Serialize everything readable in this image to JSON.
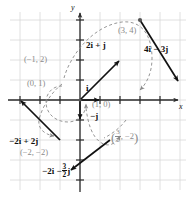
{
  "figure": {
    "type": "vector-diagram",
    "axes": {
      "x_label": "x",
      "y_label": "y",
      "x_range": [
        -4,
        5
      ],
      "y_range": [
        -4,
        5
      ],
      "grid": true,
      "grid_spacing": 1,
      "origin_px": [
        80,
        100
      ],
      "unit_px": 20
    },
    "colors": {
      "background": "#ffffff",
      "grid": "#d8d8d8",
      "axis": "#2b2b2b",
      "vector": "#111111",
      "dashed": "#8a8a8a",
      "coordinate_label": "#8a8a8a"
    },
    "vectors": [
      {
        "id": "vector-2i-plus-j",
        "label": "2i + j",
        "tip": [
          2,
          1
        ],
        "tail": [
          0,
          0
        ],
        "point_label": null
      },
      {
        "id": "vector-i",
        "label": "i",
        "tip": [
          1,
          0
        ],
        "tail": [
          0,
          0
        ],
        "point_label": "(1, 0)"
      },
      {
        "id": "vector-minus-j",
        "label": "−j",
        "tip": [
          0,
          -1
        ],
        "tail": [
          0,
          0
        ],
        "point_label": null
      },
      {
        "id": "vector-4i-minus-3j",
        "label": "4i − 3j",
        "tip": [
          5,
          -1
        ],
        "tail": [
          3,
          4
        ],
        "point_label": "(3, 4)"
      },
      {
        "id": "vector-minus-2i-plus-2j",
        "label": "−2i + 2j",
        "tip": [
          -3,
          0
        ],
        "tail": [
          -1,
          -2
        ],
        "point_label": "(−2, −2)"
      },
      {
        "id": "vector-minus-2i-minus-three-halves-j",
        "label": "−2i − (3/2)j",
        "tip": [
          -0.5,
          -3.5
        ],
        "tail": [
          1.5,
          -2
        ],
        "point_label": "(3/2, −2)"
      }
    ],
    "labels": {
      "two_i_plus_j": "2i + j",
      "four_i_minus_three_j": "4i − 3j",
      "minus_two_i_plus_two_j": "−2i + 2j",
      "unit_i": "i",
      "unit_minus_j": "−j",
      "minus_two_i": "−2i −",
      "three_halves_num": "3",
      "three_halves_den": "2",
      "j_bold": "j",
      "x_axis": "x",
      "y_axis": "y"
    },
    "coordinate_labels": {
      "point_neg1_2": "(−1, 2)",
      "point_0_1": "(0, 1)",
      "point_1_0": "(1, 0)",
      "point_3_4": "(3, 4)",
      "point_neg2_neg2": "(−2, −2)",
      "point_three_halves_neg2_open": "(",
      "point_three_halves_num": "3",
      "point_three_halves_den": "2",
      "point_three_halves_rest": ", −2",
      "point_three_halves_close": ")"
    }
  }
}
